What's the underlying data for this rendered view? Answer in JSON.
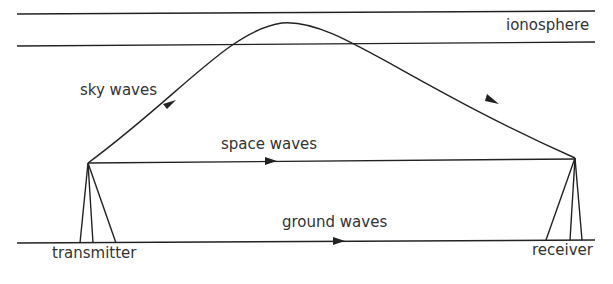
{
  "diagram": {
    "labels": {
      "ionosphere": "ionosphere",
      "sky_waves": "sky waves",
      "space_waves": "space waves",
      "ground_waves": "ground waves",
      "transmitter": "transmitter",
      "receiver": "receiver"
    },
    "colors": {
      "line": "#222222",
      "text": "#333333",
      "background": "#ffffff"
    }
  }
}
